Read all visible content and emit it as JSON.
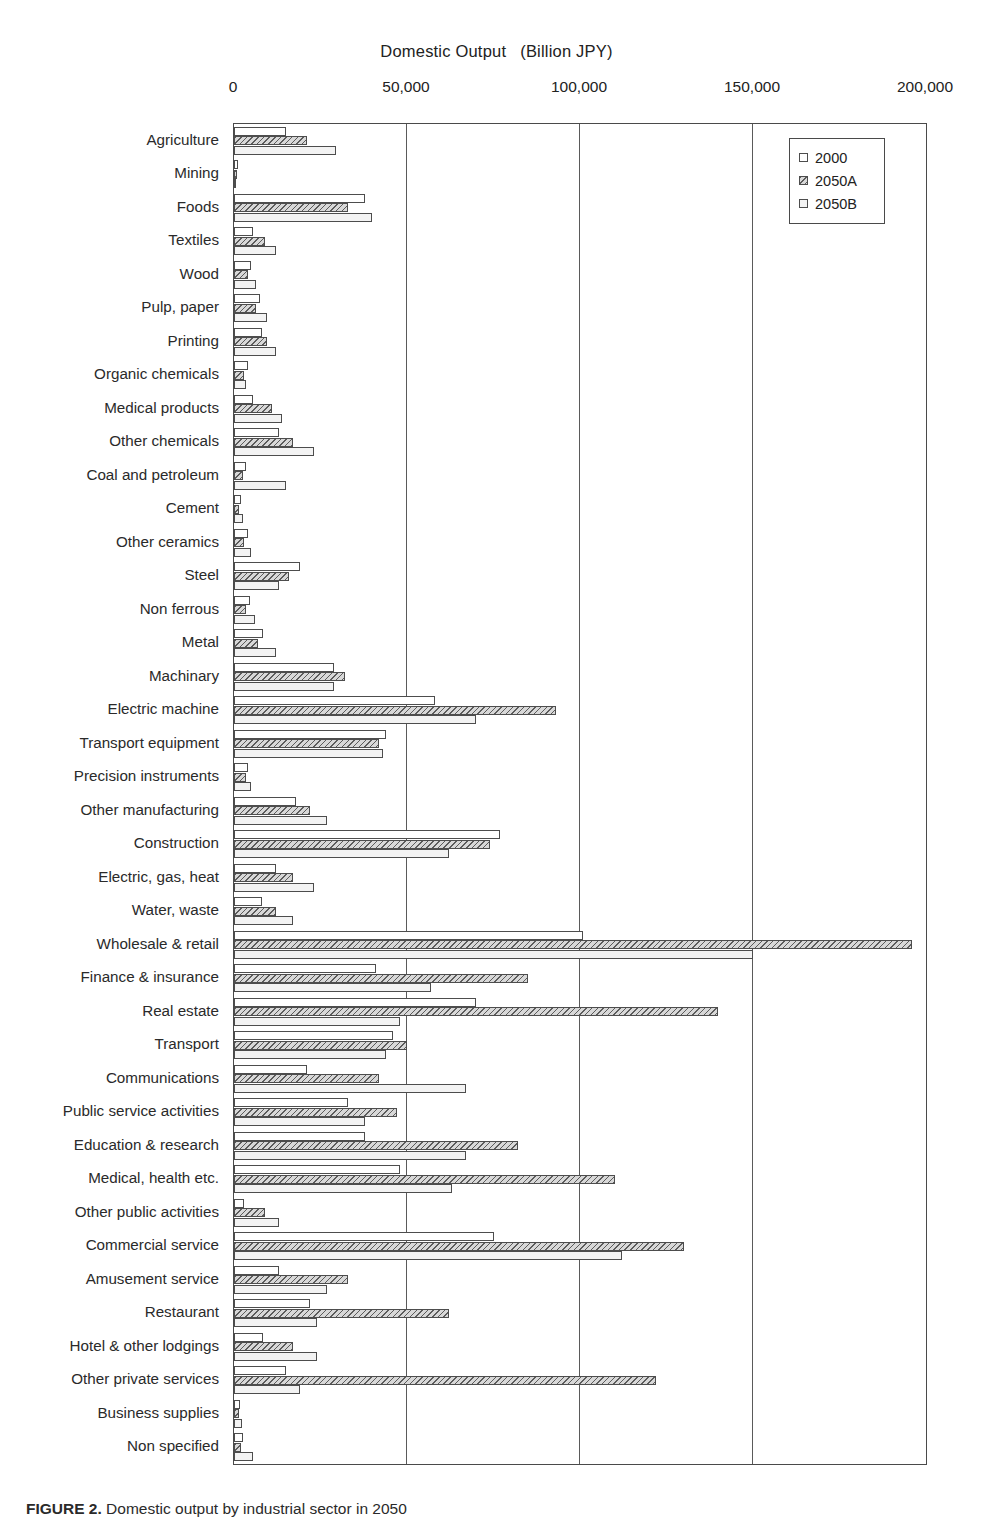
{
  "chart_data": {
    "type": "bar",
    "orientation": "horizontal",
    "title_main": "Domestic Output",
    "title_unit": "(Billion JPY)",
    "xlabel": "",
    "ylabel": "",
    "xlim": [
      0,
      200000
    ],
    "xticks": [
      0,
      50000,
      100000,
      150000,
      200000
    ],
    "xtick_labels": [
      "0",
      "50,000",
      "100,000",
      "150,000",
      "200,000"
    ],
    "grid": "vertical",
    "legend_position": "top-right",
    "legend": [
      "2000",
      "2050A",
      "2050B"
    ],
    "categories": [
      "Agriculture",
      "Mining",
      "Foods",
      "Textiles",
      "Wood",
      "Pulp, paper",
      "Printing",
      "Organic chemicals",
      "Medical products",
      "Other chemicals",
      "Coal and petroleum",
      "Cement",
      "Other ceramics",
      "Steel",
      "Non ferrous",
      "Metal",
      "Machinary",
      "Electric machine",
      "Transport equipment",
      "Precision instruments",
      "Other manufacturing",
      "Construction",
      "Electric, gas, heat",
      "Water, waste",
      "Wholesale & retail",
      "Finance & insurance",
      "Real estate",
      "Transport",
      "Communications",
      "Public service activities",
      "Education & research",
      "Medical, health etc.",
      "Other public activities",
      "Commercial service",
      "Amusement service",
      "Restaurant",
      "Hotel & other lodgings",
      "Other private services",
      "Business supplies",
      "Non specified"
    ],
    "series": [
      {
        "name": "2000",
        "fill": "white",
        "values": [
          15000,
          1200,
          38000,
          5500,
          5000,
          7500,
          8000,
          4000,
          5500,
          13000,
          3500,
          2000,
          4000,
          19000,
          4500,
          8500,
          29000,
          58000,
          44000,
          4000,
          18000,
          77000,
          12000,
          8000,
          101000,
          41000,
          70000,
          46000,
          21000,
          33000,
          38000,
          48000,
          3000,
          75000,
          13000,
          22000,
          8500,
          15000,
          1800,
          2500
        ]
      },
      {
        "name": "2050A",
        "fill": "hatch",
        "values": [
          21000,
          900,
          33000,
          9000,
          4000,
          6500,
          9500,
          3000,
          11000,
          17000,
          2500,
          1500,
          3000,
          16000,
          3500,
          7000,
          32000,
          93000,
          42000,
          3500,
          22000,
          74000,
          17000,
          12000,
          196000,
          85000,
          140000,
          50000,
          42000,
          47000,
          82000,
          110000,
          9000,
          130000,
          33000,
          62000,
          17000,
          122000,
          1400,
          2000
        ]
      },
      {
        "name": "2050B",
        "fill": "stipple",
        "values": [
          29500,
          700,
          40000,
          12000,
          6500,
          9500,
          12000,
          3500,
          14000,
          23000,
          15000,
          2500,
          5000,
          13000,
          6000,
          12000,
          29000,
          70000,
          43000,
          5000,
          27000,
          62000,
          23000,
          17000,
          150000,
          57000,
          48000,
          44000,
          67000,
          38000,
          67000,
          63000,
          13000,
          112000,
          27000,
          24000,
          24000,
          19000,
          2200,
          5500
        ]
      }
    ]
  },
  "legend": {
    "title": "",
    "items": [
      {
        "label": "2000",
        "fill": "white"
      },
      {
        "label": "2050A",
        "fill": "hatch"
      },
      {
        "label": "2050B",
        "fill": "stipple"
      }
    ]
  },
  "caption": {
    "figure_label": "FIGURE 2.",
    "text": "Domestic output by industrial sector in 2050"
  }
}
